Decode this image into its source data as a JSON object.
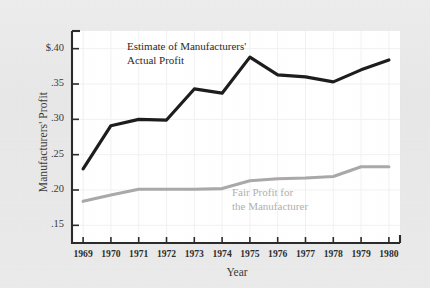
{
  "chart_data": {
    "type": "line",
    "title": "",
    "xlabel": "Year",
    "ylabel": "Manufacturers' Profit",
    "categories": [
      1969,
      1970,
      1971,
      1972,
      1973,
      1974,
      1975,
      1976,
      1977,
      1978,
      1979,
      1980
    ],
    "xtick_labels": [
      "1969",
      "1970",
      "1971",
      "1972",
      "1973",
      "1974",
      "1975",
      "1976",
      "1977",
      "1978",
      "1979",
      "1980"
    ],
    "ytick_labels": [
      "$.40",
      ".35",
      ".30",
      ".25",
      ".20",
      ".15"
    ],
    "ytick_values": [
      0.4,
      0.35,
      0.3,
      0.25,
      0.2,
      0.15
    ],
    "ylim": [
      0.125,
      0.425
    ],
    "xlim": [
      1968.6,
      1980.4
    ],
    "grid": true,
    "legend_position": "inline-annotations",
    "series": [
      {
        "name": "Estimate of Manufacturers' Actual Profit",
        "color": "#1d1d1d",
        "values": [
          0.23,
          0.291,
          0.3,
          0.299,
          0.343,
          0.337,
          0.388,
          0.363,
          0.36,
          0.353,
          0.37,
          0.384
        ]
      },
      {
        "name": "Fair Profit for the Manufacturer",
        "color": "#a9a9a9",
        "values": [
          0.184,
          0.193,
          0.201,
          0.201,
          0.201,
          0.202,
          0.213,
          0.216,
          0.217,
          0.219,
          0.233,
          0.233
        ]
      }
    ],
    "annotations": [
      {
        "name": "actual-profit-label",
        "line1": "Estimate of Manufacturers'",
        "line2": "Actual Profit",
        "color": "#2b2b2b"
      },
      {
        "name": "fair-profit-label",
        "line1": "Fair Profit for",
        "line2": "the Manufacturer",
        "color": "#b0b0b0"
      }
    ]
  },
  "colors": {
    "page_background": "#e9e9e9",
    "plot_background": "#ffffff",
    "axis": "#2b2b2b",
    "grid": "#f0f0f0",
    "series_dark": "#1d1d1d",
    "series_gray": "#a9a9a9"
  }
}
